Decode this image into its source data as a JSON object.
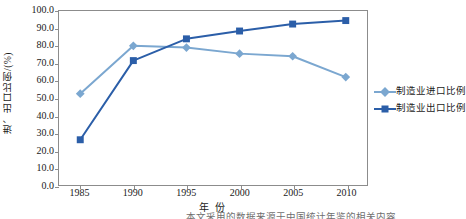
{
  "chart_data": {
    "type": "line",
    "title": "",
    "xlabel": "年 份",
    "ylabel": "进、出口比例/(%)",
    "categories": [
      "1985",
      "1990",
      "1995",
      "2000",
      "2005",
      "2010"
    ],
    "x": [
      1985,
      1990,
      1995,
      2000,
      2005,
      2010
    ],
    "xlim": [
      1983,
      2012
    ],
    "ylim": [
      0.0,
      100.0
    ],
    "ytick_labels": [
      "0.0",
      "10.0",
      "20.0",
      "30.0",
      "40.0",
      "50.0",
      "60.0",
      "70.0",
      "80.0",
      "90.0",
      "100.0"
    ],
    "yticks": [
      0,
      10,
      20,
      30,
      40,
      50,
      60,
      70,
      80,
      90,
      100
    ],
    "grid": false,
    "legend_position": "right",
    "series": [
      {
        "name": "制造业进口比例",
        "marker": "diamond",
        "color": "#7BA7D0",
        "values": [
          52.5,
          80.0,
          79.0,
          75.5,
          74.0,
          62.0
        ]
      },
      {
        "name": "制造业出口比例",
        "marker": "square",
        "color": "#2B5EA8",
        "values": [
          26.0,
          71.5,
          84.0,
          88.5,
          92.5,
          94.5
        ]
      }
    ]
  },
  "legend": {
    "items": [
      {
        "label": "制造业进口比例"
      },
      {
        "label": "制造业出口比例"
      }
    ]
  },
  "axes": {
    "y_title": "进、出口比例/(%)",
    "x_title": "年 份"
  },
  "caption": {
    "clipped_text": "本文采用的数据来源于中国统计年鉴的相关内容"
  },
  "colors": {
    "import_series": "#7BA7D0",
    "export_series": "#2B5EA8",
    "axis": "#8c8c8c",
    "background": "#ffffff"
  }
}
